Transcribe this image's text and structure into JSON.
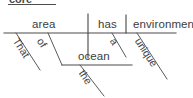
{
  "diagram": {
    "type": "reed-kellogg-sentence-diagram",
    "sentence": "That area of the ocean has a unique environment.",
    "top_caption": {
      "text": "core",
      "clipped": true
    },
    "baseline": {
      "label": "main-horizontal-baseline",
      "x1": 4,
      "y1": 33,
      "x2": 176,
      "y2": 33
    },
    "main_line": {
      "subject": "area",
      "verb": "has",
      "object": "environment"
    },
    "dividers": [
      {
        "name": "subject-verb-divider",
        "x": 88,
        "style": "full-vertical"
      },
      {
        "name": "verb-object-divider",
        "x": 126,
        "style": "half-vertical"
      }
    ],
    "modifiers": [
      {
        "word": "That",
        "modifies": "area",
        "slot": "subject-modifier-1"
      },
      {
        "word": "of",
        "modifies": "area",
        "slot": "subject-prepositional-phrase"
      },
      {
        "word": "the",
        "modifies": "ocean",
        "slot": "object-of-preposition-modifier"
      },
      {
        "word": "a",
        "modifies": "environment",
        "slot": "object-modifier-1"
      },
      {
        "word": "unique",
        "modifies": "environment",
        "slot": "object-modifier-2"
      }
    ],
    "prepositional_phrase": {
      "preposition": "of",
      "object_of_preposition": "ocean",
      "object_line": {
        "x1": 62,
        "y1": 65,
        "x2": 132,
        "y2": 65
      }
    },
    "colors": {
      "background": "#ffffff",
      "line": "#4d4d4d",
      "text": "#3d3d3d"
    }
  }
}
